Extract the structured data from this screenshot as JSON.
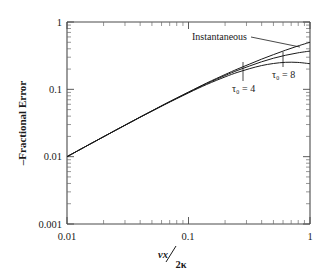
{
  "chart_data": {
    "type": "line",
    "title": "",
    "xlabel": "νx / 2κ",
    "xlabel_numerator": "νx",
    "xlabel_denominator": "2κ",
    "ylabel": "–Fractional Error",
    "xscale": "log",
    "yscale": "log",
    "xlim": [
      0.01,
      1
    ],
    "ylim": [
      0.001,
      1
    ],
    "xticks": [
      0.01,
      0.1,
      1
    ],
    "xtick_labels": [
      "0.01",
      "0.1",
      "1"
    ],
    "yticks": [
      0.001,
      0.01,
      0.1,
      1
    ],
    "ytick_labels": [
      "0.001",
      "0.01",
      "0.1",
      "1"
    ],
    "grid": false,
    "legend_position": "inline-annotations",
    "annotations": [
      {
        "label": "Instantaneous",
        "x_text": 0.115,
        "y_text": 0.6,
        "points_to_x": 0.85,
        "points_to_y": 0.44
      },
      {
        "label": "τ₀ = 4",
        "x_text": 0.33,
        "y_text": 0.145,
        "points_to_x": 0.4,
        "points_to_y": 0.225
      },
      {
        "label": "τ₀ = 8",
        "x_text": 0.65,
        "y_text": 0.195,
        "points_to_x": 0.7,
        "points_to_y": 0.262
      }
    ],
    "series": [
      {
        "name": "Instantaneous",
        "color": "#1a1a1a",
        "x": [
          0.01,
          0.0158,
          0.0251,
          0.0398,
          0.0631,
          0.1,
          0.141,
          0.2,
          0.251,
          0.316,
          0.398,
          0.501,
          0.631,
          0.794,
          1.0
        ],
        "y": [
          0.01,
          0.0157,
          0.0247,
          0.0386,
          0.0598,
          0.0912,
          0.124,
          0.166,
          0.199,
          0.236,
          0.28,
          0.328,
          0.382,
          0.44,
          0.5
        ]
      },
      {
        "name": "τ₀ = 4",
        "color": "#1a1a1a",
        "x": [
          0.01,
          0.0158,
          0.0251,
          0.0398,
          0.0631,
          0.1,
          0.141,
          0.2,
          0.251,
          0.316,
          0.398,
          0.501,
          0.631,
          0.794,
          1.0
        ],
        "y": [
          0.01,
          0.0157,
          0.0247,
          0.0385,
          0.0594,
          0.09,
          0.1215,
          0.1605,
          0.19,
          0.221,
          0.256,
          0.29,
          0.321,
          0.348,
          0.37
        ]
      },
      {
        "name": "τ₀ = 8",
        "color": "#1a1a1a",
        "x": [
          0.01,
          0.0158,
          0.0251,
          0.0398,
          0.0631,
          0.1,
          0.141,
          0.2,
          0.251,
          0.316,
          0.398,
          0.501,
          0.631,
          0.794,
          1.0
        ],
        "y": [
          0.01,
          0.0157,
          0.0246,
          0.0383,
          0.0588,
          0.0885,
          0.118,
          0.153,
          0.178,
          0.202,
          0.225,
          0.242,
          0.252,
          0.251,
          0.24
        ]
      }
    ]
  }
}
